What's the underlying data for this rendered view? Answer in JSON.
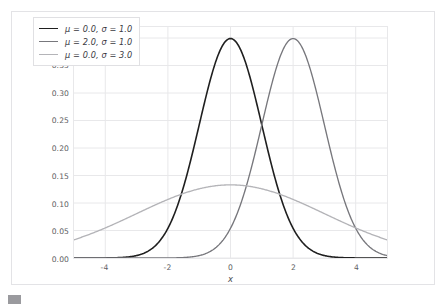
{
  "chart_data": {
    "type": "line",
    "title": "",
    "subtitle": "",
    "xlabel": "x",
    "ylabel": "",
    "xlim": [
      -5,
      5
    ],
    "ylim": [
      0,
      0.42
    ],
    "grid": true,
    "legend_position": "upper left",
    "xticks": [
      "-4",
      "-2",
      "0",
      "2",
      "4"
    ],
    "xtick_values": [
      -4,
      -2,
      0,
      2,
      4
    ],
    "yticks": [
      "0.00",
      "0.05",
      "0.10",
      "0.15",
      "0.20",
      "0.25",
      "0.30",
      "0.35",
      "0.40"
    ],
    "ytick_values": [
      0.0,
      0.05,
      0.1,
      0.15,
      0.2,
      0.25,
      0.3,
      0.35,
      0.4
    ],
    "series": [
      {
        "name": "μ = 0.0, σ = 1.0",
        "mu": 0.0,
        "sigma": 1.0,
        "color": "#1f1f1f",
        "linewidth": 1.6,
        "peak_x": 0.0,
        "peak_y": 0.3989,
        "x": [
          -5,
          -4.5,
          -4,
          -3.5,
          -3,
          -2.5,
          -2,
          -1.5,
          -1,
          -0.5,
          0,
          0.5,
          1,
          1.5,
          2,
          2.5,
          3,
          3.5,
          4,
          4.5,
          5
        ],
        "values": [
          0.0,
          0.0,
          0.0001,
          0.0009,
          0.0044,
          0.0175,
          0.054,
          0.1295,
          0.242,
          0.3521,
          0.3989,
          0.3521,
          0.242,
          0.1295,
          0.054,
          0.0175,
          0.0044,
          0.0009,
          0.0001,
          0.0,
          0.0
        ]
      },
      {
        "name": "μ = 2.0, σ = 1.0",
        "mu": 2.0,
        "sigma": 1.0,
        "color": "#77777c",
        "linewidth": 1.35,
        "peak_x": 2.0,
        "peak_y": 0.3989,
        "x": [
          -5,
          -4.5,
          -4,
          -3.5,
          -3,
          -2.5,
          -2,
          -1.5,
          -1,
          -0.5,
          0,
          0.5,
          1,
          1.5,
          2,
          2.5,
          3,
          3.5,
          4,
          4.5,
          5
        ],
        "values": [
          0.0,
          0.0,
          0.0,
          0.0,
          0.0,
          0.0,
          0.0001,
          0.0009,
          0.0044,
          0.0175,
          0.054,
          0.1295,
          0.242,
          0.3521,
          0.3989,
          0.3521,
          0.242,
          0.1295,
          0.054,
          0.0175,
          0.0044
        ]
      },
      {
        "name": "μ = 0.0, σ = 3.0",
        "mu": 0.0,
        "sigma": 3.0,
        "color": "#b4b4b8",
        "linewidth": 1.35,
        "peak_x": 0.0,
        "peak_y": 0.133,
        "x": [
          -5,
          -4.5,
          -4,
          -3.5,
          -3,
          -2.5,
          -2,
          -1.5,
          -1,
          -0.5,
          0,
          0.5,
          1,
          1.5,
          2,
          2.5,
          3,
          3.5,
          4,
          4.5,
          5
        ],
        "values": [
          0.0332,
          0.0456,
          0.0595,
          0.074,
          0.0807,
          0.0912,
          0.1065,
          0.1183,
          0.1258,
          0.1311,
          0.133,
          0.1311,
          0.1258,
          0.1183,
          0.1065,
          0.0912,
          0.0807,
          0.074,
          0.0595,
          0.0456,
          0.0332
        ]
      }
    ]
  },
  "figure": {
    "background_color": "#ffffff",
    "grid_color": "#e8e8ea",
    "tick_label_color": "#5d5d62",
    "border_color": "#e3e3e6"
  },
  "caption": {
    "text": ""
  }
}
